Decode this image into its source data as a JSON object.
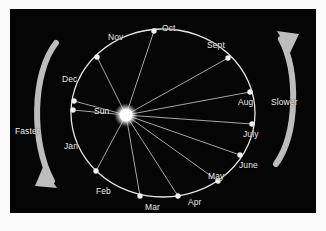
{
  "figure": {
    "background_color": "#050505",
    "frame_color": "#fbfbfb",
    "orbit_stroke": "#e6e6e6",
    "radius_line_stroke": "#b8b8b8",
    "marker_color": "#f0f0f0",
    "sun_color": "#ffffff",
    "arrow_color": "#bdbdbd",
    "text_color": "#e9e9e9"
  },
  "sun": {
    "label": "Sun",
    "cx": 116,
    "cy": 106,
    "r": 7.5,
    "label_x": 84,
    "label_y": 98
  },
  "annotations": [
    {
      "name": "faster",
      "label": "Faster",
      "side": "left",
      "direction": "downward",
      "label_x": 5,
      "label_y": 118
    },
    {
      "name": "slower",
      "label": "Slower",
      "side": "right",
      "direction": "upward",
      "label_x": 261,
      "label_y": 89
    }
  ],
  "chart_data": {
    "type": "scatter",
    "subtitle": "",
    "xlabel": "",
    "ylabel": "",
    "grid": false,
    "legend": "none",
    "annotations": [
      "Faster",
      "Slower",
      "Sun"
    ],
    "categories": [
      "Jan",
      "Feb",
      "Mar",
      "Apr",
      "May",
      "June",
      "July",
      "Aug",
      "Sept",
      "Oct",
      "Nov",
      "Dec"
    ],
    "points": [
      {
        "label": "Jan",
        "node_x": 63,
        "node_y": 101,
        "label_x": 54,
        "label_y": 133,
        "anchor": "start"
      },
      {
        "label": "Feb",
        "node_x": 86,
        "node_y": 162,
        "label_x": 86,
        "label_y": 178,
        "anchor": "start"
      },
      {
        "label": "Mar",
        "node_x": 130,
        "node_y": 187,
        "label_x": 135,
        "label_y": 194,
        "anchor": "start"
      },
      {
        "label": "Apr",
        "node_x": 168,
        "node_y": 187,
        "label_x": 178,
        "label_y": 189,
        "anchor": "start"
      },
      {
        "label": "May",
        "node_x": 208,
        "node_y": 172,
        "label_x": 198,
        "label_y": 163,
        "anchor": "start"
      },
      {
        "label": "June",
        "node_x": 230,
        "node_y": 146,
        "label_x": 229,
        "label_y": 152,
        "anchor": "start"
      },
      {
        "label": "July",
        "node_x": 242,
        "node_y": 115,
        "label_x": 233,
        "label_y": 121,
        "anchor": "start"
      },
      {
        "label": "Aug",
        "node_x": 240,
        "node_y": 83,
        "label_x": 228,
        "label_y": 89,
        "anchor": "start"
      },
      {
        "label": "Sept",
        "node_x": 218,
        "node_y": 49,
        "label_x": 197,
        "label_y": 32,
        "anchor": "start"
      },
      {
        "label": "Oct",
        "node_x": 144,
        "node_y": 22,
        "label_x": 152,
        "label_y": 15,
        "anchor": "start"
      },
      {
        "label": "Nov",
        "node_x": 87,
        "node_y": 48,
        "label_x": 98,
        "label_y": 24,
        "anchor": "start"
      },
      {
        "label": "Dec",
        "node_x": 64,
        "node_y": 92,
        "label_x": 52,
        "label_y": 66,
        "anchor": "start"
      }
    ],
    "orbit": {
      "cx": 153,
      "cy": 104,
      "rx": 92,
      "ry": 84,
      "shape": "ellipse",
      "focus_offset_x": -37
    }
  }
}
